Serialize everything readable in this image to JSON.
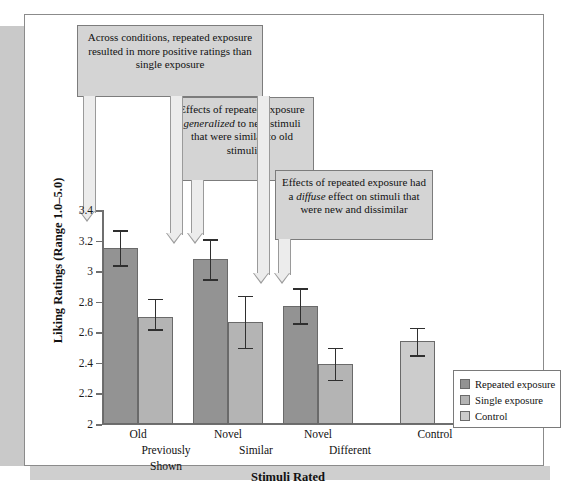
{
  "figure": {
    "axis_title_x": "Stimuli Rated",
    "axis_title_y": "Liking Ratings (Range 1.0–5.0)"
  },
  "callouts": [
    {
      "id": "callout-1",
      "text": "Across conditions, repeated exposure resulted in more positive ratings than single exposure",
      "italic_word": ""
    },
    {
      "id": "callout-2",
      "text_before": "Effects of repeated exposure ",
      "italic_word": "generalized",
      "text_after": " to new stimuli that were similar to old stimuli"
    },
    {
      "id": "callout-3",
      "text_before": "Effects of repeated exposure had a ",
      "italic_word": "diffuse",
      "text_after": " effect on stimuli that were new and dissimilar"
    }
  ],
  "legend": {
    "position": "bottom-right",
    "items": [
      {
        "label": "Repeated exposure",
        "color": "#939393"
      },
      {
        "label": "Single exposure",
        "color": "#b4b4b4"
      },
      {
        "label": "Control",
        "color": "#cccccc"
      }
    ]
  },
  "chart_data": {
    "type": "bar",
    "title": "",
    "subtitle": "",
    "xlabel": "Stimuli Rated",
    "ylabel": "Liking Ratings (Range 1.0–5.0)",
    "ylim": [
      2,
      3.4
    ],
    "yticks": [
      "2",
      "2.2",
      "2.4",
      "2.6",
      "2.8",
      "3",
      "3.2",
      "3.4"
    ],
    "ytick_values": [
      2,
      2.2,
      2.4,
      2.6,
      2.8,
      3.0,
      3.2,
      3.4
    ],
    "grid": false,
    "legend_position": "bottom-right",
    "categories": [
      {
        "line1": "Old",
        "line2": "Previously",
        "line3": "Shown"
      },
      {
        "line1": "Novel",
        "line2": "Similar",
        "line3": ""
      },
      {
        "line1": "Novel",
        "line2": "Different",
        "line3": ""
      },
      {
        "line1": "Control",
        "line2": "",
        "line3": ""
      }
    ],
    "series": [
      {
        "name": "Repeated exposure",
        "color": "#939393",
        "values": [
          3.15,
          3.08,
          2.77,
          null
        ],
        "err_low": [
          3.04,
          2.95,
          2.66,
          null
        ],
        "err_high": [
          3.27,
          3.21,
          2.89,
          null
        ]
      },
      {
        "name": "Single exposure",
        "color": "#b4b4b4",
        "values": [
          2.7,
          2.67,
          2.39,
          null
        ],
        "err_low": [
          2.62,
          2.5,
          2.29,
          null
        ],
        "err_high": [
          2.82,
          2.84,
          2.5,
          null
        ]
      },
      {
        "name": "Control",
        "color": "#cccccc",
        "values": [
          null,
          null,
          null,
          2.54
        ],
        "err_low": [
          null,
          null,
          null,
          2.45
        ],
        "err_high": [
          null,
          null,
          null,
          2.63
        ]
      }
    ]
  }
}
